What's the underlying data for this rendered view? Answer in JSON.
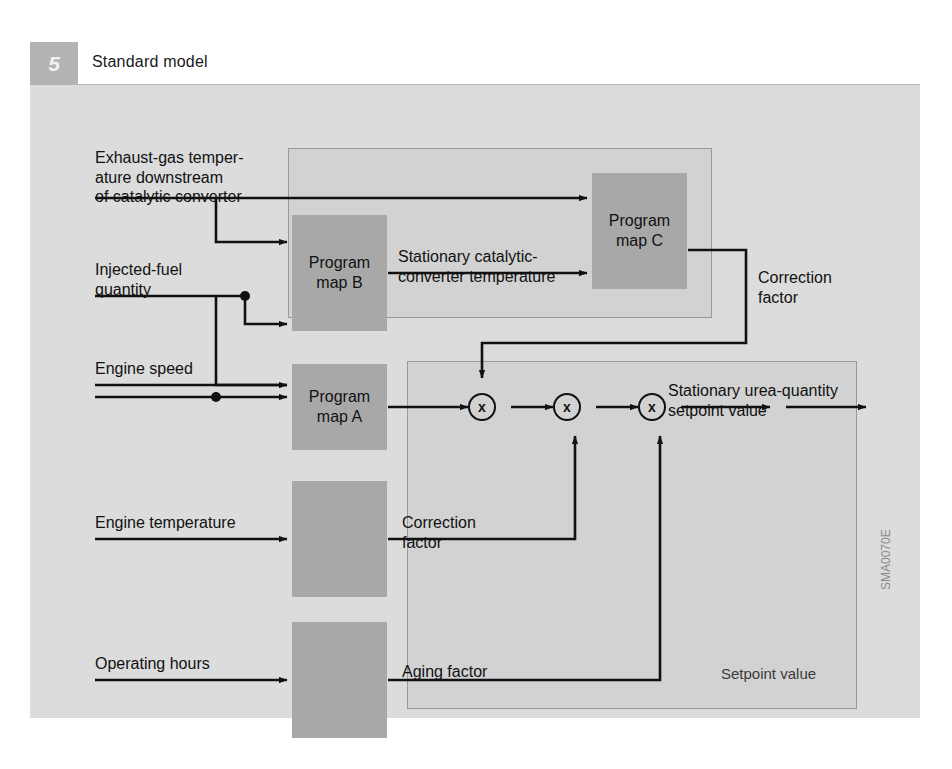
{
  "figure": {
    "number": "5",
    "title": "Standard model",
    "code": "SMA0070E"
  },
  "inputs": [
    {
      "id": "exhaust-gas-temperature",
      "label": "Exhaust-gas temper-\nature downstream\nof catalytic converter"
    },
    {
      "id": "injected-fuel-quantity",
      "label": "Injected-fuel\nquantity"
    },
    {
      "id": "engine-speed",
      "label": "Engine speed"
    },
    {
      "id": "engine-temperature",
      "label": "Engine temperature"
    },
    {
      "id": "operating-hours",
      "label": "Operating hours"
    }
  ],
  "blocks": [
    {
      "id": "program-map-a",
      "label": "Program\nmap A"
    },
    {
      "id": "program-map-b",
      "label": "Program\nmap B"
    },
    {
      "id": "program-map-c",
      "label": "Program\nmap C"
    }
  ],
  "signals": [
    {
      "id": "stationary-cat-temp",
      "label": "Stationary catalytic-\nconverter temperature"
    },
    {
      "id": "correction-factor-c",
      "label": "Correction\nfactor"
    },
    {
      "id": "correction-factor-eng",
      "label": "Correction\nfactor"
    },
    {
      "id": "aging-factor",
      "label": "Aging factor"
    },
    {
      "id": "output",
      "label": "Stationary urea-quantity\nsetpoint value"
    }
  ],
  "operators": [
    {
      "id": "multiplier-1",
      "symbol": "x"
    },
    {
      "id": "multiplier-2",
      "symbol": "x"
    },
    {
      "id": "multiplier-3",
      "symbol": "x"
    }
  ],
  "panels": [
    {
      "id": "temperature-model-panel",
      "caption": ""
    },
    {
      "id": "setpoint-value-panel",
      "caption": "Setpoint value"
    }
  ],
  "colors": {
    "card_bg": "#dcdcdc",
    "panel_bg": "#d2d2d2",
    "block_bg": "#a8a8a8",
    "line": "#111111",
    "badge_bg": "#b3b3b3"
  }
}
